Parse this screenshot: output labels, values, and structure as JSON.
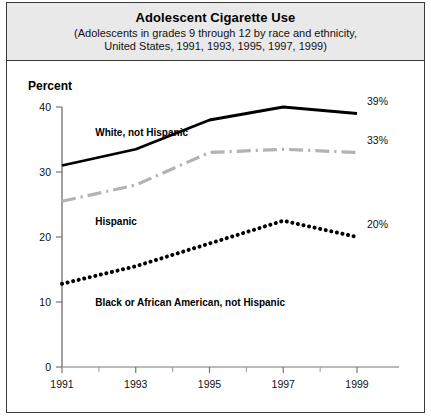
{
  "figure": {
    "title": "Adolescent Cigarette Use",
    "subtitle_line1": "(Adolescents in grades 9 through 12 by race and ethnicity,",
    "subtitle_line2": "United States, 1991, 1993, 1995, 1997, 1999)",
    "axis_label_y": "Percent",
    "border_color": "#3a3a3a",
    "title_band_color": "#e9e9e9"
  },
  "chart_data": {
    "type": "line",
    "title": "Adolescent Cigarette Use",
    "subtitle": "(Adolescents in grades 9 through 12 by race and ethnicity, United States, 1991, 1993, 1995, 1997, 1999)",
    "xlabel": "",
    "ylabel": "Percent",
    "x": [
      1991,
      1993,
      1995,
      1997,
      1999
    ],
    "xtick_labels": [
      "1991",
      "1993",
      "1995",
      "1997",
      "1999"
    ],
    "ytick_labels": [
      "0",
      "10",
      "20",
      "30",
      "40"
    ],
    "yticks": [
      0,
      10,
      20,
      30,
      40
    ],
    "ylim": [
      0,
      40
    ],
    "xlim": [
      1991,
      1999
    ],
    "grid": false,
    "legend_position": "inline-annotations",
    "series": [
      {
        "name": "White, not Hispanic",
        "values": [
          31,
          33.5,
          38,
          40,
          39
        ],
        "style": "solid",
        "color": "#000000",
        "end_label": "39%"
      },
      {
        "name": "Hispanic",
        "values": [
          25.5,
          28,
          33,
          33.5,
          33
        ],
        "style": "dash-dot",
        "color": "#b3b3b3",
        "end_label": "33%"
      },
      {
        "name": "Black or African American, not Hispanic",
        "values": [
          12.8,
          15.5,
          19,
          22.5,
          20
        ],
        "style": "dotted",
        "color": "#000000",
        "end_label": "20%"
      }
    ],
    "annotations": [
      {
        "text": "White, not Hispanic",
        "x": 1991.9,
        "y": 35.6
      },
      {
        "text": "Hispanic",
        "x": 1991.9,
        "y": 21.9
      },
      {
        "text": "Black or African American, not Hispanic",
        "x": 1991.9,
        "y": 9.4
      }
    ]
  }
}
